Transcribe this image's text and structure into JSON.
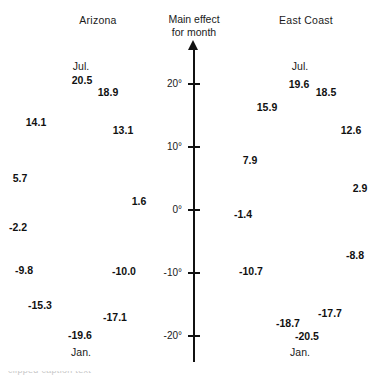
{
  "figure": {
    "background": "#ffffff",
    "ink_color": "#111111"
  },
  "axis": {
    "title_line1": "Main effect",
    "title_line2": "for month",
    "ticks": [
      {
        "label": "20°",
        "value": 20
      },
      {
        "label": "10°",
        "value": 10
      },
      {
        "label": "0°",
        "value": 0
      },
      {
        "label": "-10°",
        "value": -10
      },
      {
        "label": "-20°",
        "value": -20
      }
    ],
    "arrow_direction": "up"
  },
  "panels": {
    "left": {
      "title": "Arizona",
      "top_season": "Jul.",
      "bottom_season": "Jan."
    },
    "right": {
      "title": "East Coast",
      "top_season": "Jul.",
      "bottom_season": "Jan."
    }
  },
  "caption_remnant": "clipped caption text",
  "chart_data": {
    "type": "scatter",
    "title": "Main effect for month",
    "xlabel": "",
    "ylabel": "Main effect for month",
    "ylim": [
      -22,
      22
    ],
    "yticks": [
      20,
      10,
      0,
      -10,
      -20
    ],
    "ytick_labels": [
      "20°",
      "10°",
      "0°",
      "-10°",
      "-20°"
    ],
    "grid": false,
    "legend": "none",
    "annotations": [
      "Jul.",
      "Jan."
    ],
    "series": [
      {
        "name": "Arizona",
        "labels": [
          "20.5",
          "18.9",
          "14.1",
          "13.1",
          "5.7",
          "1.6",
          "-2.2",
          "-9.8",
          "-10.0",
          "-15.3",
          "-17.1",
          "-19.6"
        ],
        "values": [
          20.5,
          18.9,
          14.1,
          13.1,
          5.7,
          1.6,
          -2.2,
          -9.8,
          -10.0,
          -15.3,
          -17.1,
          -19.6
        ]
      },
      {
        "name": "East Coast",
        "labels": [
          "19.6",
          "18.5",
          "15.9",
          "12.6",
          "7.9",
          "2.9",
          "-1.4",
          "-8.8",
          "-10.7",
          "-17.7",
          "-18.7",
          "-20.5"
        ],
        "values": [
          19.6,
          18.5,
          15.9,
          12.6,
          7.9,
          2.9,
          -1.4,
          -8.8,
          -10.7,
          -17.7,
          -18.7,
          -20.5
        ]
      }
    ]
  },
  "left_points": [
    {
      "label": "20.5",
      "x": 82,
      "y": 80
    },
    {
      "label": "18.9",
      "x": 108,
      "y": 92
    },
    {
      "label": "14.1",
      "x": 36,
      "y": 122
    },
    {
      "label": "13.1",
      "x": 123,
      "y": 130
    },
    {
      "label": "5.7",
      "x": 20,
      "y": 178
    },
    {
      "label": "1.6",
      "x": 139,
      "y": 201
    },
    {
      "label": "-2.2",
      "x": 18,
      "y": 227
    },
    {
      "label": "-9.8",
      "x": 24,
      "y": 270
    },
    {
      "label": "-10.0",
      "x": 124,
      "y": 271
    },
    {
      "label": "-15.3",
      "x": 40,
      "y": 305
    },
    {
      "label": "-17.1",
      "x": 115,
      "y": 317
    },
    {
      "label": "-19.6",
      "x": 80,
      "y": 335
    }
  ],
  "left_seasons": [
    {
      "label": "Jul.",
      "x": 81,
      "y": 66
    },
    {
      "label": "Jan.",
      "x": 81,
      "y": 352
    }
  ],
  "right_points": [
    {
      "label": "19.6",
      "x": 299,
      "y": 84
    },
    {
      "label": "18.5",
      "x": 326,
      "y": 92
    },
    {
      "label": "15.9",
      "x": 267,
      "y": 107
    },
    {
      "label": "12.6",
      "x": 351,
      "y": 130
    },
    {
      "label": "7.9",
      "x": 250,
      "y": 160
    },
    {
      "label": "2.9",
      "x": 360,
      "y": 188
    },
    {
      "label": "-1.4",
      "x": 243,
      "y": 214
    },
    {
      "label": "-8.8",
      "x": 355,
      "y": 255
    },
    {
      "label": "-10.7",
      "x": 251,
      "y": 271
    },
    {
      "label": "-17.7",
      "x": 330,
      "y": 313
    },
    {
      "label": "-18.7",
      "x": 288,
      "y": 323
    },
    {
      "label": "-20.5",
      "x": 307,
      "y": 336
    }
  ],
  "right_seasons": [
    {
      "label": "Jul.",
      "x": 300,
      "y": 66
    },
    {
      "label": "Jan.",
      "x": 300,
      "y": 352
    }
  ]
}
